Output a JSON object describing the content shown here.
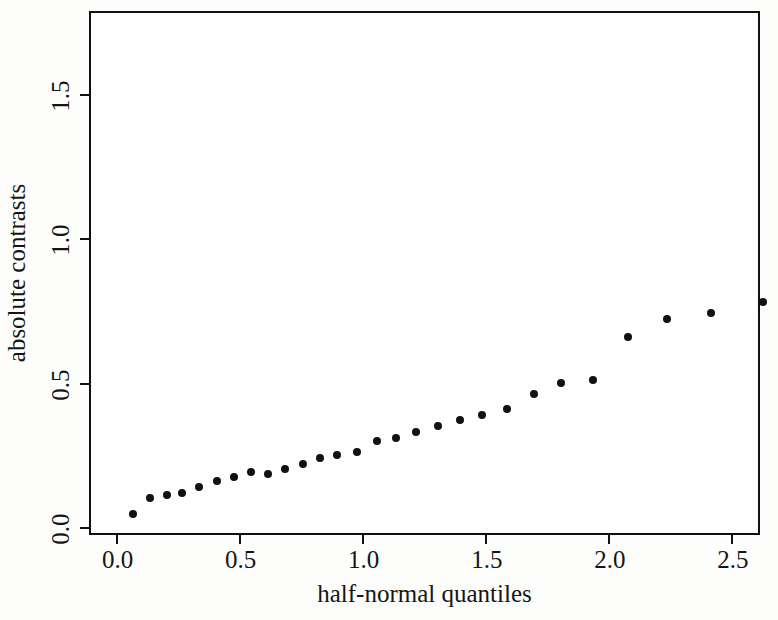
{
  "chart_data": {
    "type": "scatter",
    "title": "",
    "xlabel": "half-normal quantiles",
    "ylabel": "absolute contrasts",
    "xlim": [
      -0.1,
      2.61
    ],
    "ylim": [
      -0.02,
      1.78
    ],
    "xticks": [
      "0.0",
      "0.5",
      "1.0",
      "1.5",
      "2.0",
      "2.5"
    ],
    "xtick_values": [
      0.0,
      0.5,
      1.0,
      1.5,
      2.0,
      2.5
    ],
    "yticks": [
      "0.0",
      "0.5",
      "1.0",
      "1.5"
    ],
    "ytick_values": [
      0.0,
      0.5,
      1.0,
      1.5
    ],
    "grid": false,
    "legend": null,
    "marker": "filled-circle",
    "marker_color": "#111111",
    "frame_color": "#111111",
    "background": "#fdfdfb",
    "points": [
      {
        "x": 0.07,
        "y": 0.045
      },
      {
        "x": 0.14,
        "y": 0.1
      },
      {
        "x": 0.21,
        "y": 0.11
      },
      {
        "x": 0.27,
        "y": 0.12
      },
      {
        "x": 0.34,
        "y": 0.14
      },
      {
        "x": 0.41,
        "y": 0.16
      },
      {
        "x": 0.48,
        "y": 0.175
      },
      {
        "x": 0.55,
        "y": 0.19
      },
      {
        "x": 0.62,
        "y": 0.185
      },
      {
        "x": 0.69,
        "y": 0.2
      },
      {
        "x": 0.76,
        "y": 0.22
      },
      {
        "x": 0.83,
        "y": 0.24
      },
      {
        "x": 0.9,
        "y": 0.25
      },
      {
        "x": 0.98,
        "y": 0.26
      },
      {
        "x": 1.06,
        "y": 0.3
      },
      {
        "x": 1.14,
        "y": 0.31
      },
      {
        "x": 1.22,
        "y": 0.33
      },
      {
        "x": 1.31,
        "y": 0.35
      },
      {
        "x": 1.4,
        "y": 0.37
      },
      {
        "x": 1.49,
        "y": 0.39
      },
      {
        "x": 1.59,
        "y": 0.41
      },
      {
        "x": 1.7,
        "y": 0.46
      },
      {
        "x": 1.81,
        "y": 0.5
      },
      {
        "x": 1.94,
        "y": 0.51
      },
      {
        "x": 2.08,
        "y": 0.66
      },
      {
        "x": 2.24,
        "y": 0.72
      },
      {
        "x": 2.42,
        "y": 0.74
      },
      {
        "x": 2.63,
        "y": 0.78
      },
      {
        "x": 2.91,
        "y": 0.79
      },
      {
        "x": 3.31,
        "y": 1.01
      },
      {
        "x": 3.81,
        "y": 1.12
      },
      {
        "x": 4.65,
        "y": 1.505
      },
      {
        "x": 5.85,
        "y": 1.72
      }
    ],
    "annotations": [
      {
        "label": "A",
        "subscript": "l",
        "point_x": 5.85,
        "point_y": 1.72
      }
    ]
  }
}
